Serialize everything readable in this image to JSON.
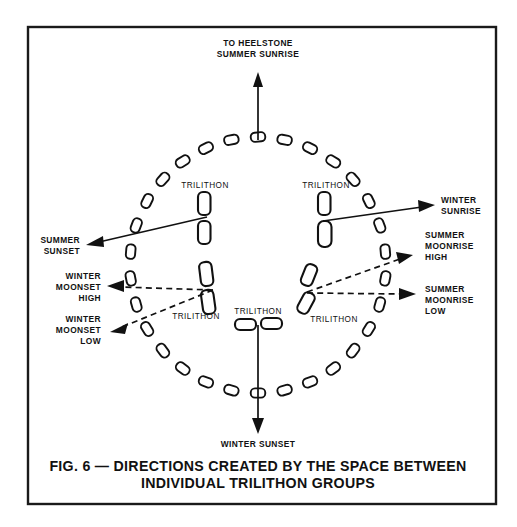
{
  "figure": {
    "caption_line1": "FIG. 6 — DIRECTIONS CREATED BY THE SPACE BETWEEN",
    "caption_line2": "INDIVIDUAL TRILITHON GROUPS",
    "ink_color": "#111111",
    "background_color": "#ffffff",
    "border_color": "#1a1a1a"
  },
  "chart_data": {
    "type": "diagram",
    "center": {
      "x": 258,
      "y": 265
    },
    "outer_circle_radius": 128,
    "outer_stone_count": 30,
    "sightlines": [
      {
        "id": "heelstone-summer-sunrise",
        "label": "TO HEELSTONE\nSUMMER SUNRISE",
        "style": "solid",
        "direction": "north",
        "from": {
          "x": 258,
          "y": 137
        },
        "to": {
          "x": 258,
          "y": 77
        }
      },
      {
        "id": "winter-sunset",
        "label": "WINTER SUNSET",
        "style": "solid",
        "direction": "south",
        "from": {
          "x": 258,
          "y": 325
        },
        "to": {
          "x": 258,
          "y": 430
        }
      },
      {
        "id": "summer-sunset",
        "label": "SUMMER SUNSET",
        "style": "solid",
        "direction": "west-northwest",
        "from": {
          "x": 205,
          "y": 218
        },
        "to": {
          "x": 92,
          "y": 243
        }
      },
      {
        "id": "winter-sunrise",
        "label": "WINTER SUNRISE",
        "style": "solid",
        "direction": "east-northeast",
        "from": {
          "x": 325,
          "y": 222
        },
        "to": {
          "x": 430,
          "y": 205
        }
      },
      {
        "id": "winter-moonset-high",
        "label": "WINTER MOONSET HIGH",
        "style": "dashed",
        "direction": "west",
        "from": {
          "x": 213,
          "y": 290
        },
        "to": {
          "x": 110,
          "y": 286
        }
      },
      {
        "id": "winter-moonset-low",
        "label": "WINTER MOONSET LOW",
        "style": "dashed",
        "direction": "west-southwest",
        "from": {
          "x": 213,
          "y": 290
        },
        "to": {
          "x": 113,
          "y": 330
        }
      },
      {
        "id": "summer-moonrise-high",
        "label": "SUMMER MOONRISE HIGH",
        "style": "dashed",
        "direction": "east-northeast",
        "from": {
          "x": 308,
          "y": 292
        },
        "to": {
          "x": 410,
          "y": 256
        }
      },
      {
        "id": "summer-moonrise-low",
        "label": "SUMMER MOONRISE LOW",
        "style": "dashed",
        "direction": "east",
        "from": {
          "x": 308,
          "y": 292
        },
        "to": {
          "x": 412,
          "y": 294
        }
      }
    ],
    "trilithons": [
      {
        "id": "trilithon-nw",
        "label": "TRILITHON",
        "label_x": 205,
        "label_y": 189,
        "orientation": "vertical-pair"
      },
      {
        "id": "trilithon-ne",
        "label": "TRILITHON",
        "label_x": 328,
        "label_y": 189,
        "orientation": "vertical-pair"
      },
      {
        "id": "trilithon-sw",
        "label": "TRILITHON",
        "label_x": 196,
        "label_y": 317,
        "orientation": "vertical-pair"
      },
      {
        "id": "trilithon-s",
        "label": "TRILITHON",
        "label_x": 258,
        "label_y": 313,
        "orientation": "horizontal-pair"
      },
      {
        "id": "trilithon-se",
        "label": "TRILITHON",
        "label_x": 333,
        "label_y": 320,
        "orientation": "vertical-pair"
      }
    ]
  },
  "labels": {
    "top": {
      "line1": "TO HEELSTONE",
      "line2": "SUMMER SUNRISE"
    },
    "bottom": {
      "line1": "WINTER SUNSET"
    },
    "summer_sunset": {
      "line1": "SUMMER",
      "line2": "SUNSET"
    },
    "winter_moonset_high": {
      "line1": "WINTER",
      "line2": "MOONSET",
      "line3": "HIGH"
    },
    "winter_moonset_low": {
      "line1": "WINTER",
      "line2": "MOONSET",
      "line3": "LOW"
    },
    "winter_sunrise": {
      "line1": "WINTER",
      "line2": "SUNRISE"
    },
    "summer_moonrise_high": {
      "line1": "SUMMER",
      "line2": "MOONRISE",
      "line3": "HIGH"
    },
    "summer_moonrise_low": {
      "line1": "SUMMER",
      "line2": "MOONRISE",
      "line3": "LOW"
    },
    "trilithon_nw": "TRILITHON",
    "trilithon_ne": "TRILITHON",
    "trilithon_sw": "TRILITHON",
    "trilithon_s": "TRILITHON",
    "trilithon_se": "TRILITHON"
  }
}
